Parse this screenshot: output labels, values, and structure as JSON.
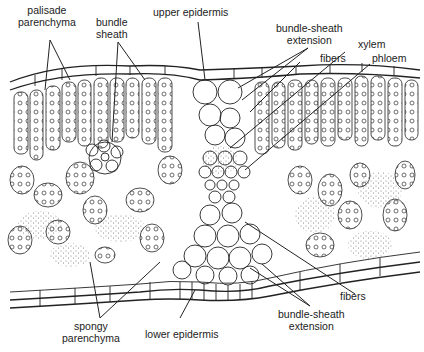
{
  "diagram": {
    "labels": {
      "palisade": [
        "palisade",
        "parenchyma"
      ],
      "bundle_sheath": [
        "bundle",
        "sheath"
      ],
      "upper_epidermis": "upper epidermis",
      "bse_top": [
        "bundle-sheath",
        "extension"
      ],
      "xylem": "xylem",
      "fibers_top": "fibers",
      "phloem": "phloem",
      "fibers_bottom": "fibers",
      "spongy": [
        "spongy",
        "parenchyma"
      ],
      "lower_epidermis": "lower epidermis",
      "bse_bottom": [
        "bundle-sheath",
        "extension"
      ]
    },
    "colors": {
      "line": "#222222",
      "background": "#ffffff",
      "stipple": "#555555"
    }
  }
}
